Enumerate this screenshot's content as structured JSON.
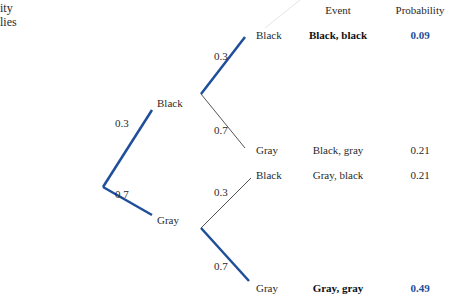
{
  "caption_fragment": {
    "line1": "ity",
    "line2": "lies"
  },
  "columns": {
    "event": "Event",
    "probability": "Probability"
  },
  "tree": {
    "root": {
      "branches": [
        {
          "label": "Black",
          "prob": "0.3",
          "highlight": true
        },
        {
          "label": "Gray",
          "prob": "0.7",
          "highlight": true
        }
      ]
    },
    "black_subtree": [
      {
        "label": "Black",
        "prob": "0.3",
        "highlight": true
      },
      {
        "label": "Gray",
        "prob": "0.7",
        "highlight": false
      }
    ],
    "gray_subtree": [
      {
        "label": "Black",
        "prob": "0.3",
        "highlight": false
      },
      {
        "label": "Gray",
        "prob": "0.7",
        "highlight": true
      }
    ]
  },
  "outcomes": [
    {
      "event": "Black, black",
      "probability": "0.09",
      "emphasized": true
    },
    {
      "event": "Black, gray",
      "probability": "0.21",
      "emphasized": false
    },
    {
      "event": "Gray, black",
      "probability": "0.21",
      "emphasized": false
    },
    {
      "event": "Gray, gray",
      "probability": "0.49",
      "emphasized": true
    }
  ],
  "colors": {
    "highlight_branch": "#1f4e9a",
    "plain_branch": "#555555",
    "emphasis_value": "#1f4e9a"
  }
}
